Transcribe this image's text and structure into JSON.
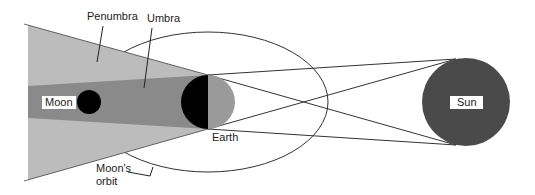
{
  "diagram": {
    "labels": {
      "penumbra": "Penumbra",
      "umbra": "Umbra",
      "moon": "Moon",
      "earth": "Earth",
      "sun": "Sun",
      "orbit_line1": "Moon's",
      "orbit_line2": "orbit"
    },
    "colors": {
      "penumbra": "#bcbcbc",
      "umbra": "#8a8a8a",
      "moon": "#000000",
      "earth_night": "#000000",
      "earth_day": "#9a9a9a",
      "sun": "#4a4a4a",
      "lines": "#333333",
      "background": "#ffffff"
    },
    "bodies": {
      "sun": {
        "cx": 466,
        "cy": 102,
        "r": 44
      },
      "earth": {
        "cx": 208,
        "cy": 102,
        "r": 27
      },
      "moon": {
        "cx": 89,
        "cy": 102,
        "r": 12
      }
    }
  }
}
